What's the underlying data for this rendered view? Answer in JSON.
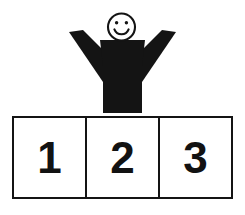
{
  "scene": {
    "title": "Stick figure standing behind three numbered boxes",
    "background_color": "#ffffff",
    "ink_color": "#141414"
  },
  "figure": {
    "name": "smiley-stick-figure",
    "head": {
      "shape": "circle-outline",
      "expression": "smiling",
      "eyes": 2,
      "outline_color": "#141414",
      "fill_color": "#ffffff"
    },
    "body": {
      "shape": "tapered-torso",
      "fill_color": "#141414"
    },
    "arms": {
      "count": 2,
      "pose": "raised-v",
      "fill_color": "#141414"
    }
  },
  "boxes": {
    "count": 3,
    "border_color": "#141414",
    "fill_color": "#ffffff",
    "items": [
      {
        "label": "1"
      },
      {
        "label": "2"
      },
      {
        "label": "3"
      }
    ]
  }
}
